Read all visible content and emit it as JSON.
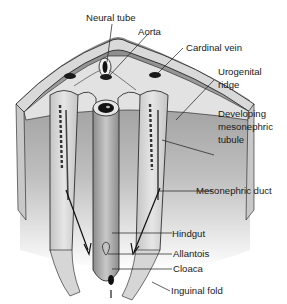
{
  "diagram": {
    "labels": {
      "neural_tube": "Neural tube",
      "aorta": "Aorta",
      "cardinal_vein": "Cardinal vein",
      "urogenital_ridge_1": "Urogenital",
      "urogenital_ridge_2": "ridge",
      "developing_1": "Developing",
      "developing_2": "mesonephric",
      "developing_3": "tubule",
      "mesonephric_duct": "Mesonephric duct",
      "hindgut": "Hindgut",
      "allantois": "Allantois",
      "cloaca": "Cloaca",
      "inguinal_fold": "Inguinal fold"
    },
    "colors": {
      "background": "#ffffff",
      "tissue_light": "#d9d9d9",
      "tissue_mid": "#a8a8a8",
      "tissue_dark": "#6e6e6e",
      "outline": "#1a1a1a"
    }
  }
}
